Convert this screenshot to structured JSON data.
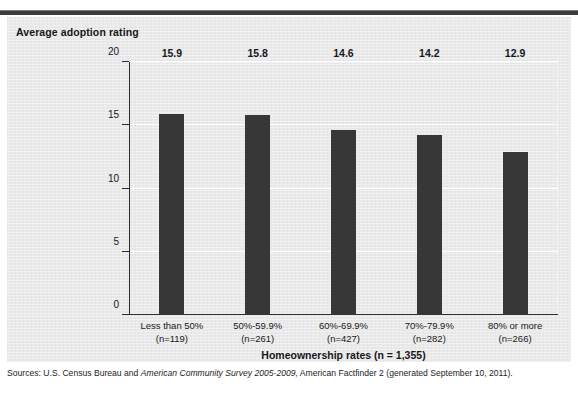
{
  "figure": {
    "caption_remnant": "",
    "y_axis_title": "Average adoption rating",
    "x_axis_title": "Homeownership  rates (n = 1,355)",
    "source_prefix": "Sources: U.S. Census Bureau and ",
    "source_italic": "American Community Survey 2005-2009,",
    "source_suffix": " American Factfinder 2 (generated September 10, 2011).",
    "panel_bg": "#e9e9e9",
    "bar_color": "#373737",
    "rule_color": "#3c3c3c"
  },
  "chart_data": {
    "type": "bar",
    "title": "",
    "xlabel": "Homeownership  rates (n = 1,355)",
    "ylabel": "Average adoption rating",
    "ylim": [
      0,
      20
    ],
    "yticks": [
      0,
      5,
      10,
      15,
      20
    ],
    "ytick_labels": [
      "0",
      "5",
      "10",
      "15",
      "20"
    ],
    "grid": "horizontal-white",
    "legend": "none",
    "categories": [
      "Less than 50%",
      "50%-59.9%",
      "60%-69.9%",
      "70%-79.9%",
      "80% or more"
    ],
    "category_counts": [
      "(n=119)",
      "(n=261)",
      "(n=427)",
      "(n=282)",
      "(n=266)"
    ],
    "values": [
      15.9,
      15.8,
      14.6,
      14.2,
      12.9
    ],
    "value_labels": [
      "15.9",
      "15.8",
      "14.6",
      "14.2",
      "12.9"
    ],
    "total_n": "1,355"
  }
}
